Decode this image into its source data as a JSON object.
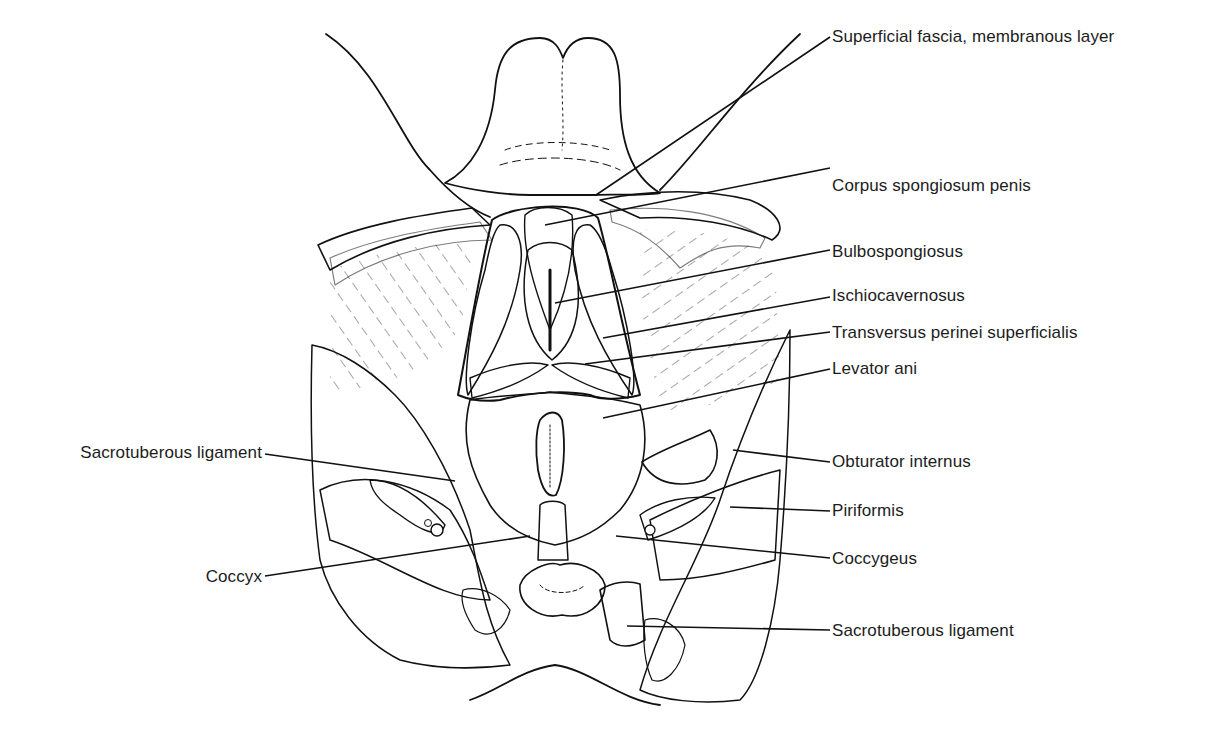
{
  "figure": {
    "colors": {
      "ink": "#111111",
      "background": "#ffffff",
      "label_text": "#1c1c1c"
    }
  },
  "labels": {
    "right": [
      {
        "id": "superficial-fascia",
        "text": "Superficial fascia, membranous layer",
        "y": 37,
        "leader": {
          "x1": 596,
          "y1": 195,
          "x2": 830,
          "y2": 37
        }
      },
      {
        "id": "corpus-spongiosum",
        "text": "Corpus spongiosum penis",
        "y": 186,
        "leader": {
          "x1": 545,
          "y1": 225,
          "x2": 830,
          "y2": 168
        }
      },
      {
        "id": "bulbospongiosus",
        "text": "Bulbospongiosus",
        "y": 252,
        "leader": {
          "x1": 555,
          "y1": 303,
          "x2": 830,
          "y2": 250
        }
      },
      {
        "id": "ischiocavernosus",
        "text": "Ischiocavernosus",
        "y": 296,
        "leader": {
          "x1": 603,
          "y1": 338,
          "x2": 830,
          "y2": 297
        }
      },
      {
        "id": "transversus-perinei",
        "text": "Transversus perinei superficialis",
        "y": 333,
        "leader": {
          "x1": 585,
          "y1": 364,
          "x2": 830,
          "y2": 332
        }
      },
      {
        "id": "levator-ani",
        "text": "Levator ani",
        "y": 369,
        "leader": {
          "x1": 603,
          "y1": 418,
          "x2": 830,
          "y2": 369
        }
      },
      {
        "id": "obturator-internus",
        "text": "Obturator internus",
        "y": 461,
        "leader": {
          "x1": 733,
          "y1": 450,
          "x2": 830,
          "y2": 462
        }
      },
      {
        "id": "piriformis",
        "text": "Piriformis",
        "y": 511,
        "leader": {
          "x1": 730,
          "y1": 507,
          "x2": 830,
          "y2": 511
        }
      },
      {
        "id": "coccygeus",
        "text": "Coccygeus",
        "y": 559,
        "leader": {
          "x1": 616,
          "y1": 536,
          "x2": 830,
          "y2": 558
        }
      },
      {
        "id": "sacrotuberous-right",
        "text": "Sacrotuberous ligament",
        "y": 631,
        "leader": {
          "x1": 627,
          "y1": 626,
          "x2": 830,
          "y2": 630
        }
      }
    ],
    "left": [
      {
        "id": "sacrotuberous-left",
        "text": "Sacrotuberous ligament",
        "y": 453,
        "leader": {
          "x1": 265,
          "y1": 454,
          "x2": 455,
          "y2": 481
        }
      },
      {
        "id": "coccyx",
        "text": "Coccyx",
        "y": 577,
        "leader": {
          "x1": 265,
          "y1": 576,
          "x2": 530,
          "y2": 536
        }
      }
    ]
  }
}
